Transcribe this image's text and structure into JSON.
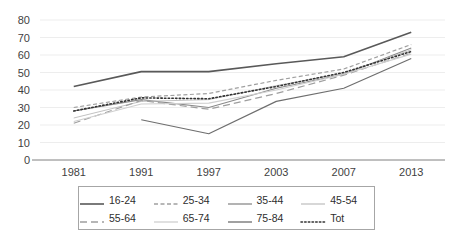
{
  "chart_data": {
    "type": "line",
    "title": "",
    "xlabel": "",
    "ylabel": "",
    "categories": [
      "1981",
      "1991",
      "1997",
      "2003",
      "2007",
      "2013"
    ],
    "ylim": [
      0,
      80
    ],
    "ytick_step": 10,
    "yticks": [
      "80",
      "70",
      "60",
      "50",
      "40",
      "30",
      "20",
      "10",
      "0"
    ],
    "grid": true,
    "legend_position": "bottom",
    "series": [
      {
        "name": "16-24",
        "values": [
          42,
          50.5,
          50.5,
          55,
          59,
          73
        ],
        "color": "#595959",
        "style": "solid",
        "width": 1.6
      },
      {
        "name": "25-34",
        "values": [
          30,
          36,
          38,
          45.5,
          52,
          66
        ],
        "color": "#a0a0a0",
        "style": "dashed-fine",
        "width": 1.2
      },
      {
        "name": "35-44",
        "values": [
          28,
          34.5,
          30,
          41,
          49,
          64
        ],
        "color": "#8a8a8a",
        "style": "solid",
        "width": 1.1
      },
      {
        "name": "45-54",
        "values": [
          24,
          33.5,
          34.5,
          42.5,
          49.5,
          63
        ],
        "color": "#c2c2c2",
        "style": "solid",
        "width": 1.0
      },
      {
        "name": "55-64",
        "values": [
          21,
          34,
          29,
          38,
          48.5,
          61
        ],
        "color": "#9e9e9e",
        "style": "dashed-long",
        "width": 1.2
      },
      {
        "name": "65-74",
        "values": [
          22,
          32,
          32.5,
          40,
          49,
          60.5
        ],
        "color": "#cfcfcf",
        "style": "solid",
        "width": 1.1
      },
      {
        "name": "75-84",
        "values": [
          null,
          23,
          15,
          33.5,
          41,
          58
        ],
        "color": "#6e6e6e",
        "style": "solid",
        "width": 1.2
      },
      {
        "name": "Tot",
        "values": [
          28,
          35.5,
          35,
          42,
          50,
          62
        ],
        "color": "#333333",
        "style": "dotted",
        "width": 1.6
      }
    ]
  },
  "legend": {
    "rows": [
      [
        "16-24",
        "25-34",
        "35-44",
        "45-54"
      ],
      [
        "55-64",
        "65-74",
        "75-84",
        "Tot"
      ]
    ]
  }
}
